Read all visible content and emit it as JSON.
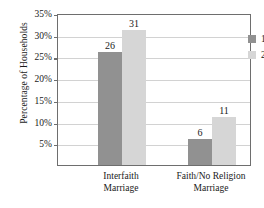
{
  "chart_data": {
    "type": "bar",
    "title": "",
    "subtitle": "",
    "xlabel": "",
    "ylabel": "Percentage of Households",
    "categories": [
      "Interfaith Marriage",
      "Faith/No Religion Marriage"
    ],
    "category_lines": [
      [
        "Interfaith",
        "Marriage"
      ],
      [
        "Faith/No Religion",
        "Marriage"
      ]
    ],
    "series": [
      {
        "name": "1988",
        "values": [
          26,
          6
        ],
        "color": "#919191"
      },
      {
        "name": "2008",
        "values": [
          31,
          11
        ],
        "color": "#d6d6d6"
      }
    ],
    "ylim": [
      0,
      35
    ],
    "ytick_values": [
      5,
      10,
      15,
      20,
      25,
      30,
      35
    ],
    "ytick_labels": [
      "5%",
      "10%",
      "15%",
      "20%",
      "25%",
      "30%",
      "35%"
    ],
    "data_labels": [
      "26",
      "31",
      "6",
      "11"
    ],
    "grid": true,
    "grid_axis": "y",
    "legend_position": "top-right",
    "legend_entries": [
      "1988",
      "2008"
    ]
  },
  "axes": {
    "y_title": "Percentage of Households"
  },
  "legend": {
    "items": [
      {
        "label": "1988"
      },
      {
        "label": "2008"
      }
    ]
  }
}
